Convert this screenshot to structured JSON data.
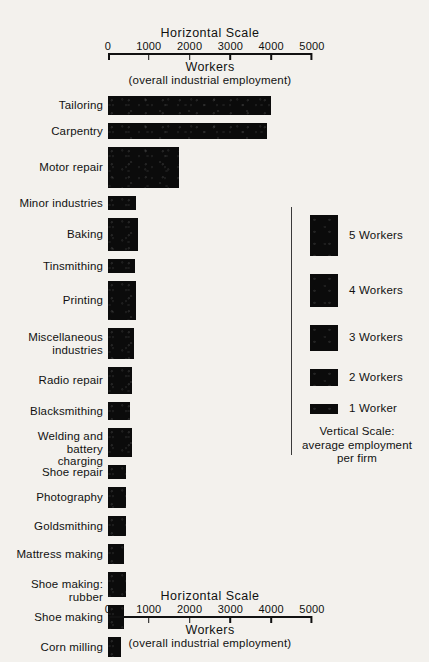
{
  "chart_data": {
    "type": "bar",
    "orientation": "horizontal",
    "title": "Horizontal  Scale",
    "xlabel": "Workers",
    "xsublabel": "(overall industrial employment)",
    "ylabel": "Vertical Scale: average employment per firm",
    "xlim": [
      0,
      5000
    ],
    "xticks": [
      0,
      1000,
      2000,
      3000,
      4000,
      5000
    ],
    "xticklabels": [
      "0",
      "1000",
      "2000",
      "3000",
      "4000",
      "5000"
    ],
    "grid": false,
    "legend_position": "right",
    "categories": [
      "Tailoring",
      "Carpentry",
      "Motor repair",
      "Minor industries",
      "Baking",
      "Tinsmithing",
      "Printing",
      "Miscellaneous\nindustries",
      "Radio repair",
      "Blacksmithing",
      "Welding and battery\ncharging",
      "Shoe repair",
      "Photography",
      "Goldsmithing",
      "Mattress making",
      "Shoe making: rubber",
      "Shoe making",
      "Corn milling"
    ],
    "values": [
      4000,
      3900,
      1730,
      690,
      740,
      660,
      690,
      640,
      590,
      540,
      590,
      440,
      440,
      440,
      390,
      440,
      390,
      320
    ],
    "thickness_workers_per_firm": [
      2.3,
      1.9,
      5.0,
      1.7,
      4.0,
      1.7,
      4.8,
      3.8,
      3.3,
      2.2,
      3.5,
      1.7,
      2.6,
      2.4,
      2.4,
      3.1,
      2.9,
      2.4
    ],
    "legend_title": "Vertical Scale:",
    "legend_subtitle": "average employment\nper firm",
    "legend_entries": [
      {
        "label": "5 Workers",
        "workers": 5
      },
      {
        "label": "4 Workers",
        "workers": 4
      },
      {
        "label": "3 Workers",
        "workers": 3
      },
      {
        "label": "2 Workers",
        "workers": 2
      },
      {
        "label": "1 Worker",
        "workers": 1
      }
    ]
  },
  "top_scale": {
    "title": "Horizontal  Scale",
    "ticks": [
      "0",
      "1000",
      "2000",
      "3000",
      "4000",
      "5000"
    ],
    "caption_main": "Workers",
    "caption_sub": "(overall industrial employment)"
  },
  "bottom_scale": {
    "title": "Horizontal  Scale",
    "ticks": [
      "0",
      "1000",
      "2000",
      "3000",
      "4000",
      "5000"
    ],
    "caption_main": "Workers",
    "caption_sub": "(overall industrial employment)"
  },
  "rows": [
    {
      "label": "Tailoring",
      "value": 4000,
      "height": 19
    },
    {
      "label": "Carpentry",
      "value": 3900,
      "height": 16
    },
    {
      "label": "Motor repair",
      "value": 1730,
      "height": 41
    },
    {
      "label": "Minor industries",
      "value": 690,
      "height": 14
    },
    {
      "label": "Baking",
      "value": 740,
      "height": 33
    },
    {
      "label": "Tinsmithing",
      "value": 660,
      "height": 14
    },
    {
      "label": "Printing",
      "value": 690,
      "height": 39
    },
    {
      "label": "Miscellaneous\nindustries",
      "value": 640,
      "height": 31
    },
    {
      "label": "Radio repair",
      "value": 590,
      "height": 27
    },
    {
      "label": "Blacksmithing",
      "value": 540,
      "height": 18
    },
    {
      "label": "Welding and battery\ncharging",
      "value": 590,
      "height": 29
    },
    {
      "label": "Shoe repair",
      "value": 440,
      "height": 14
    },
    {
      "label": "Photography",
      "value": 440,
      "height": 21
    },
    {
      "label": "Goldsmithing",
      "value": 440,
      "height": 20
    },
    {
      "label": "Mattress making",
      "value": 390,
      "height": 20
    },
    {
      "label": "Shoe making: rubber",
      "value": 440,
      "height": 25
    },
    {
      "label": "Shoe making",
      "value": 390,
      "height": 24
    },
    {
      "label": "Corn milling",
      "value": 320,
      "height": 20
    }
  ],
  "legend": {
    "entries": [
      {
        "label": "5 Workers",
        "height": 41
      },
      {
        "label": "4 Workers",
        "height": 33
      },
      {
        "label": "3 Workers",
        "height": 26
      },
      {
        "label": "2 Workers",
        "height": 17
      },
      {
        "label": "1 Worker",
        "height": 10
      }
    ],
    "note_line1": "Vertical  Scale:",
    "note_line2": "average employment",
    "note_line3": "per firm"
  },
  "colors": {
    "background": "#f3f1ed",
    "ink": "#111111",
    "bar": "#0b0b0b",
    "rule": "#3a3a3a"
  }
}
